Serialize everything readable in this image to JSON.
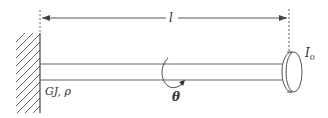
{
  "diagram": {
    "type": "torsional-shaft-with-end-disk",
    "labels": {
      "length": "l",
      "shaft_properties": "GJ, ρ",
      "disk_inertia_base": "I",
      "disk_inertia_sub": "0",
      "angle": "θ"
    },
    "components": [
      {
        "name": "fixed-wall",
        "description": "hatched fixed support on left"
      },
      {
        "name": "shaft",
        "description": "uniform shaft of length l"
      },
      {
        "name": "end-disk",
        "description": "rigid disk with rotary inertia I0 at free end"
      },
      {
        "name": "rotation-arrow",
        "description": "curved arrow indicating twist angle θ"
      },
      {
        "name": "length-dimension",
        "description": "dimension arrow spanning shaft length l"
      }
    ],
    "colors": {
      "stroke": "#555555",
      "text": "#333333",
      "background": "#ffffff"
    }
  }
}
